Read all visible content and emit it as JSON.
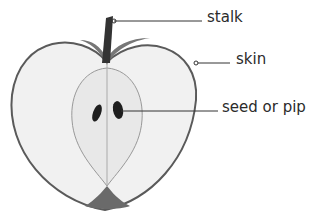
{
  "diagram": {
    "labels": [
      {
        "id": "stalk",
        "text": "stalk"
      },
      {
        "id": "skin",
        "text": "skin"
      },
      {
        "id": "seed",
        "text": "seed or pip"
      }
    ]
  },
  "colors": {
    "skin_outline": "#5a5a5a",
    "flesh": "#f1f1f1",
    "core": "#e8e8e8",
    "stalk": "#333333",
    "shade": "#777777",
    "seed": "#1e1e1e",
    "leader": "#333333",
    "text": "#2b2b2b"
  }
}
